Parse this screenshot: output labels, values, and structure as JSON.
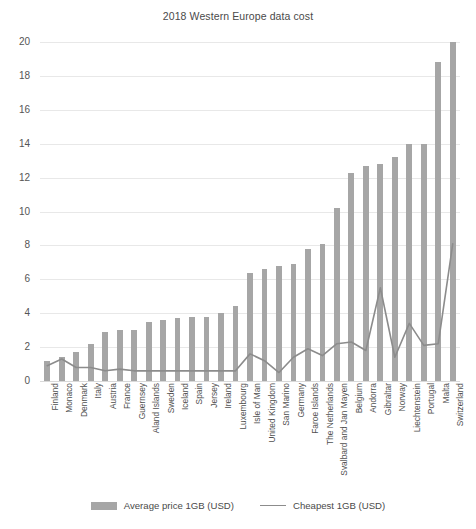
{
  "chart_data": {
    "type": "bar",
    "title": "2018 Western Europe data cost",
    "xlabel": "",
    "ylabel": "",
    "ylim": [
      0,
      20
    ],
    "ytick_step": 2,
    "yticks": [
      0,
      2,
      4,
      6,
      8,
      10,
      12,
      14,
      16,
      18,
      20
    ],
    "grid": true,
    "legend_position": "bottom",
    "categories": [
      "Finland",
      "Monaco",
      "Denmark",
      "Italy",
      "Austria",
      "France",
      "Guernsey",
      "Aland Islands",
      "Sweden",
      "Iceland",
      "Spain",
      "Jersey",
      "Ireland",
      "Luxembourg",
      "Isle of Man",
      "United Kingdom",
      "San Marino",
      "Germany",
      "Faroe Islands",
      "The Netherlands",
      "Svalbard and Jan Mayen",
      "Belgium",
      "Andorra",
      "Gibraltar",
      "Norway",
      "Liechtenstein",
      "Portugal",
      "Malta",
      "Switzerland"
    ],
    "series": [
      {
        "name": "Average price 1GB (USD)",
        "type": "bar",
        "color": "#a6a6a6",
        "values": [
          1.2,
          1.4,
          1.7,
          2.2,
          2.9,
          3.0,
          3.0,
          3.5,
          3.6,
          3.7,
          3.8,
          3.8,
          4.0,
          4.4,
          6.4,
          6.6,
          6.8,
          6.9,
          7.8,
          8.1,
          10.2,
          12.3,
          12.7,
          12.8,
          13.2,
          14.0,
          14.0,
          18.8,
          20.0
        ]
      },
      {
        "name": "Cheapest 1GB (USD)",
        "type": "line",
        "color": "#8c8c8c",
        "values": [
          0.9,
          1.3,
          0.8,
          0.8,
          0.6,
          0.7,
          0.6,
          0.6,
          0.6,
          0.6,
          0.6,
          0.6,
          0.6,
          0.6,
          1.6,
          1.2,
          0.5,
          1.4,
          1.9,
          1.5,
          2.2,
          2.3,
          1.8,
          5.5,
          1.4,
          3.4,
          2.1,
          2.2,
          8.1
        ]
      }
    ],
    "legend": [
      {
        "label": "Average price 1GB (USD)",
        "marker": "bar-swatch"
      },
      {
        "label": "Cheapest 1GB (USD)",
        "marker": "line-swatch"
      }
    ]
  }
}
